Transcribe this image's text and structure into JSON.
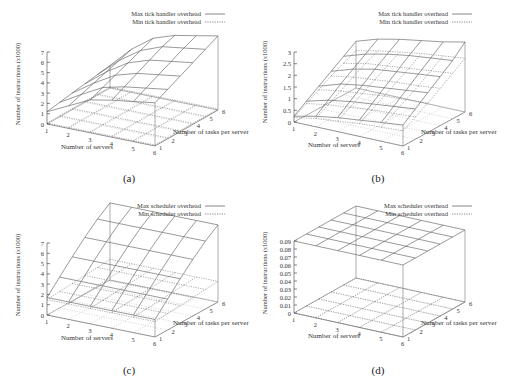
{
  "figure": {
    "panels": [
      {
        "id": "a",
        "caption": "(a)"
      },
      {
        "id": "b",
        "caption": "(b)"
      },
      {
        "id": "c",
        "caption": "(c)"
      },
      {
        "id": "d",
        "caption": "(d)"
      }
    ]
  },
  "chart_data": [
    {
      "panel": "(a)",
      "type": "surface3d",
      "title": "",
      "xlabel": "Number of servers",
      "ylabel": "Number of tasks per server",
      "zlabel": "Number of instructions (x1000)",
      "x_ticks": [
        "1",
        "2",
        "3",
        "4",
        "5",
        "6"
      ],
      "y_ticks": [
        "1",
        "2",
        "3",
        "4",
        "5",
        "6"
      ],
      "z_ticks": [
        "0",
        "1",
        "2",
        "3",
        "4",
        "5",
        "6",
        "7"
      ],
      "zlim": [
        0,
        7
      ],
      "legend": [
        "Max tick handler overhead",
        "Min tick handler overhead"
      ],
      "legend_position": "top-right",
      "x": [
        1,
        2,
        3,
        4,
        5,
        6
      ],
      "y": [
        1,
        2,
        3,
        4,
        5,
        6
      ],
      "series": [
        {
          "name": "Max tick handler overhead",
          "style": "solid",
          "values": [
            [
              1.2,
              1.4,
              1.6,
              1.8,
              2.0,
              2.2
            ],
            [
              2.2,
              2.6,
              3.0,
              3.4,
              3.8,
              4.2
            ],
            [
              3.2,
              3.7,
              4.2,
              4.7,
              5.2,
              5.7
            ],
            [
              3.6,
              4.2,
              4.8,
              5.4,
              6.0,
              6.4
            ],
            [
              3.9,
              4.5,
              5.1,
              5.7,
              6.3,
              6.8
            ],
            [
              4.2,
              4.8,
              5.4,
              6.0,
              6.6,
              7.2
            ]
          ]
        },
        {
          "name": "Min tick handler overhead",
          "style": "dotted",
          "values": [
            [
              0.1,
              0.1,
              0.1,
              0.1,
              0.1,
              0.1
            ],
            [
              0.1,
              0.1,
              0.1,
              0.1,
              0.1,
              0.1
            ],
            [
              0.1,
              0.1,
              0.1,
              0.1,
              0.1,
              0.1
            ],
            [
              0.1,
              0.1,
              0.1,
              0.1,
              0.1,
              0.1
            ],
            [
              0.1,
              0.1,
              0.1,
              0.1,
              0.1,
              0.1
            ],
            [
              0.1,
              0.1,
              0.1,
              0.1,
              0.1,
              0.1
            ]
          ]
        }
      ]
    },
    {
      "panel": "(b)",
      "type": "surface3d",
      "title": "",
      "xlabel": "Number of servers",
      "ylabel": "Number of tasks per server",
      "zlabel": "Number of instructions (x1000)",
      "x_ticks": [
        "1",
        "2",
        "3",
        "4",
        "5",
        "6"
      ],
      "y_ticks": [
        "1",
        "2",
        "3",
        "4",
        "5",
        "6"
      ],
      "z_ticks": [
        "0",
        "0.5",
        "1",
        "1.5",
        "2",
        "2.5",
        "3"
      ],
      "zlim": [
        0,
        3
      ],
      "legend": [
        "Max tick handler overhead",
        "Min tick handler overhead"
      ],
      "legend_position": "top-right",
      "x": [
        1,
        2,
        3,
        4,
        5,
        6
      ],
      "y": [
        1,
        2,
        3,
        4,
        5,
        6
      ],
      "series": [
        {
          "name": "Max tick handler overhead",
          "style": "solid",
          "values": [
            [
              0.25,
              0.6,
              0.95,
              1.3,
              1.65,
              2.0
            ],
            [
              0.45,
              0.85,
              1.25,
              1.6,
              1.95,
              2.3
            ],
            [
              0.6,
              1.0,
              1.4,
              1.8,
              2.15,
              2.5
            ],
            [
              0.7,
              1.1,
              1.5,
              1.9,
              2.3,
              2.65
            ],
            [
              0.8,
              1.2,
              1.6,
              2.0,
              2.4,
              2.8
            ],
            [
              0.9,
              1.3,
              1.7,
              2.1,
              2.5,
              3.0
            ]
          ]
        },
        {
          "name": "Min tick handler overhead",
          "style": "dotted",
          "values": [
            [
              0.2,
              0.5,
              0.8,
              1.1,
              1.35,
              1.6
            ],
            [
              0.35,
              0.65,
              0.95,
              1.25,
              1.55,
              1.8
            ],
            [
              0.45,
              0.75,
              1.05,
              1.35,
              1.65,
              1.95
            ],
            [
              0.55,
              0.85,
              1.15,
              1.45,
              1.75,
              2.1
            ],
            [
              0.6,
              0.9,
              1.2,
              1.5,
              1.85,
              2.2
            ],
            [
              0.65,
              0.95,
              1.25,
              1.6,
              1.95,
              2.3
            ]
          ]
        }
      ]
    },
    {
      "panel": "(c)",
      "type": "surface3d",
      "title": "",
      "xlabel": "Number of servers",
      "ylabel": "Number of tasks per server",
      "zlabel": "Number of instructions (x1000)",
      "x_ticks": [
        "1",
        "2",
        "3",
        "4",
        "5",
        "6"
      ],
      "y_ticks": [
        "1",
        "2",
        "3",
        "4",
        "5",
        "6"
      ],
      "z_ticks": [
        "0",
        "1",
        "2",
        "3",
        "4",
        "5",
        "6",
        "7"
      ],
      "zlim": [
        0,
        7
      ],
      "legend": [
        "Max scheduler overhead",
        "Min scheduler overhead"
      ],
      "legend_position": "top-right",
      "x": [
        1,
        2,
        3,
        4,
        5,
        6
      ],
      "y": [
        1,
        2,
        3,
        4,
        5,
        6
      ],
      "series": [
        {
          "name": "Max scheduler overhead",
          "style": "solid",
          "values": [
            [
              1.7,
              3.0,
              4.3,
              5.5,
              6.6,
              7.5
            ],
            [
              1.7,
              3.0,
              4.3,
              5.5,
              6.6,
              7.5
            ],
            [
              1.7,
              3.0,
              4.3,
              5.5,
              6.6,
              7.5
            ],
            [
              1.7,
              3.0,
              4.3,
              5.5,
              6.6,
              7.5
            ],
            [
              1.7,
              3.0,
              4.3,
              5.5,
              6.6,
              7.5
            ],
            [
              1.7,
              3.0,
              4.3,
              5.5,
              6.6,
              7.5
            ]
          ]
        },
        {
          "name": "Min scheduler overhead",
          "style": "dotted",
          "values": [
            [
              1.5,
              1.6,
              1.7,
              1.8,
              1.9,
              2.0
            ],
            [
              1.5,
              1.6,
              1.7,
              1.8,
              1.9,
              2.0
            ],
            [
              1.5,
              1.6,
              1.7,
              1.8,
              1.9,
              2.0
            ],
            [
              1.5,
              1.6,
              1.7,
              1.8,
              1.9,
              2.0
            ],
            [
              1.5,
              1.6,
              1.7,
              1.8,
              1.9,
              2.0
            ],
            [
              1.5,
              1.6,
              1.7,
              1.8,
              1.9,
              2.0
            ]
          ]
        }
      ]
    },
    {
      "panel": "(d)",
      "type": "surface3d",
      "title": "",
      "xlabel": "Number of servers",
      "ylabel": "Number of tasks per server",
      "zlabel": "Number of instructions (x1000)",
      "x_ticks": [
        "1",
        "2",
        "3",
        "4",
        "5",
        "6"
      ],
      "y_ticks": [
        "1",
        "2",
        "3",
        "4",
        "5",
        "6"
      ],
      "z_ticks": [
        "0",
        "0.01",
        "0.02",
        "0.03",
        "0.04",
        "0.05",
        "0.06",
        "0.07",
        "0.08",
        "0.09"
      ],
      "zlim": [
        0,
        0.09
      ],
      "legend": [
        "Max scheduler overhead",
        "Min scheduler overhead"
      ],
      "legend_position": "top-right",
      "x": [
        1,
        2,
        3,
        4,
        5,
        6
      ],
      "y": [
        1,
        2,
        3,
        4,
        5,
        6
      ],
      "series": [
        {
          "name": "Max scheduler overhead",
          "style": "solid",
          "values": [
            [
              0.09,
              0.09,
              0.09,
              0.09,
              0.09,
              0.09
            ],
            [
              0.09,
              0.09,
              0.09,
              0.09,
              0.09,
              0.09
            ],
            [
              0.09,
              0.09,
              0.09,
              0.09,
              0.09,
              0.09
            ],
            [
              0.09,
              0.09,
              0.09,
              0.09,
              0.09,
              0.09
            ],
            [
              0.09,
              0.09,
              0.09,
              0.09,
              0.09,
              0.09
            ],
            [
              0.09,
              0.09,
              0.09,
              0.09,
              0.09,
              0.09
            ]
          ]
        },
        {
          "name": "Min scheduler overhead",
          "style": "dotted",
          "values": [
            [
              0.0,
              0.0,
              0.0,
              0.0,
              0.0,
              0.0
            ],
            [
              0.0,
              0.0,
              0.0,
              0.0,
              0.0,
              0.0
            ],
            [
              0.0,
              0.0,
              0.0,
              0.0,
              0.0,
              0.0
            ],
            [
              0.0,
              0.0,
              0.0,
              0.0,
              0.0,
              0.0
            ],
            [
              0.0,
              0.0,
              0.0,
              0.0,
              0.0,
              0.0
            ],
            [
              0.0,
              0.0,
              0.0,
              0.0,
              0.0,
              0.0
            ]
          ]
        }
      ]
    }
  ]
}
